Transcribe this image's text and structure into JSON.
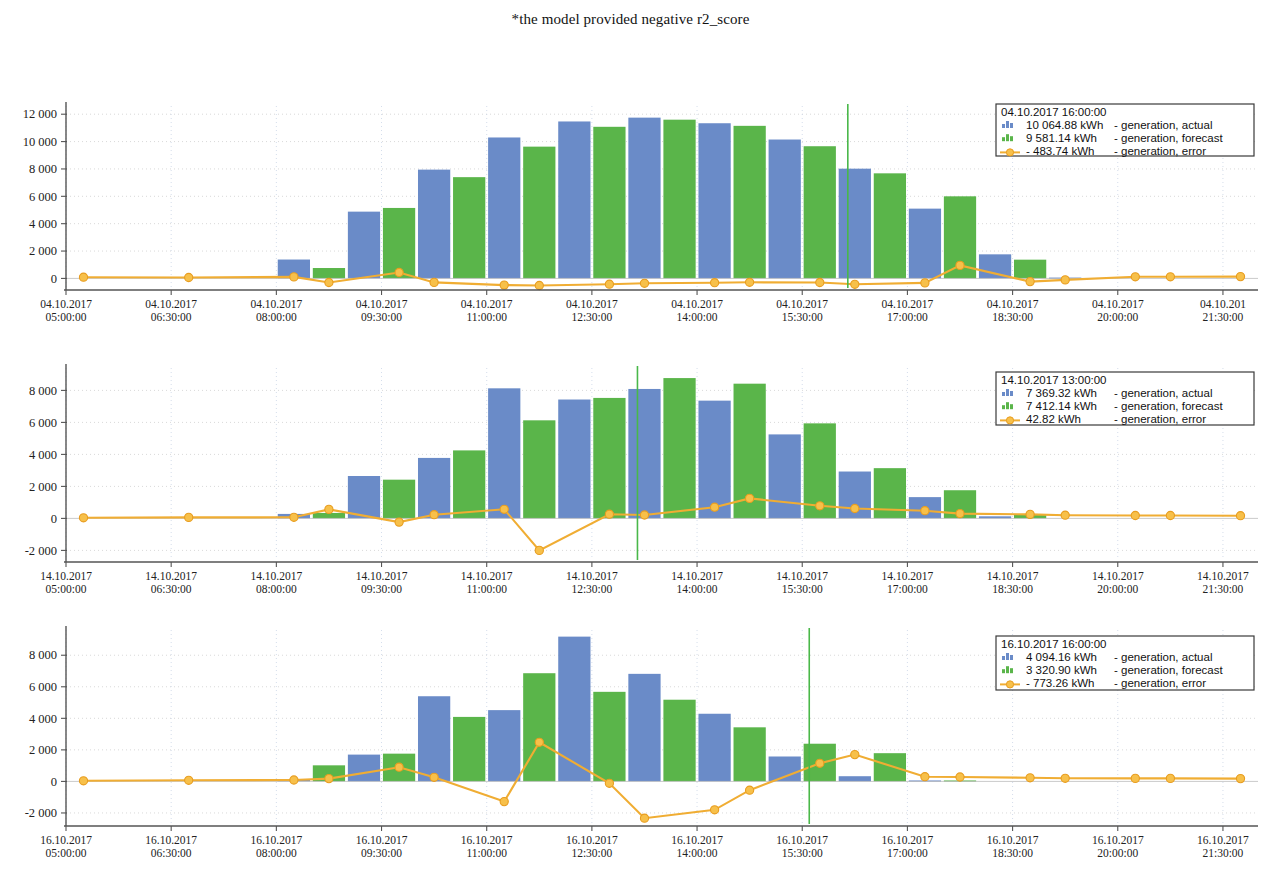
{
  "note": "*the model provided negative r2_score",
  "colors": {
    "actual": "#6a8bc8",
    "forecast": "#5ab54a",
    "error": "#f0ad33",
    "error_dot": "#f7c04a",
    "cursor": "#49b849",
    "axis": "#555555",
    "grid": "#cfcfcf"
  },
  "series_labels": {
    "actual": "- generation, actual",
    "forecast": "- generation, forecast",
    "error": "- generation, error",
    "unit": "kWh"
  },
  "chart_data": [
    {
      "type": "bar",
      "id": "chart-2017-10-04",
      "title": "",
      "xlabel": "",
      "ylabel": "",
      "ylim": [
        -700,
        12600
      ],
      "yticks": [
        0,
        2000,
        4000,
        6000,
        8000,
        10000,
        12000
      ],
      "ytick_labels": [
        "0",
        "2 000",
        "4 000",
        "6 000",
        "8 000",
        "10 000",
        "12 000"
      ],
      "grid": true,
      "date": "04.10.2017",
      "xtick_labels": [
        "04.10.2017\n05:00:00",
        "04.10.2017\n06:30:00",
        "04.10.2017\n08:00:00",
        "04.10.2017\n09:30:00",
        "04.10.2017\n11:00:00",
        "04.10.2017\n12:30:00",
        "04.10.2017\n14:00:00",
        "04.10.2017\n15:30:00",
        "04.10.2017\n17:00:00",
        "04.10.2017\n18:30:00",
        "04.10.2017\n20:00:00",
        "04.10.201\n21:30:00"
      ],
      "xtick_positions": [
        0,
        3,
        6,
        9,
        12,
        15,
        18,
        21,
        24,
        27,
        30,
        33
      ],
      "n_slots": 34,
      "categories": [
        "05:00",
        "05:30",
        "06:00",
        "06:30",
        "07:00",
        "07:30",
        "08:00",
        "08:30",
        "09:00",
        "09:30",
        "10:00",
        "10:30",
        "11:00",
        "11:30",
        "12:00",
        "12:30",
        "13:00",
        "13:30",
        "14:00",
        "14:30",
        "15:00",
        "15:30",
        "16:00",
        "16:30",
        "17:00",
        "17:30",
        "18:00",
        "18:30",
        "19:00",
        "19:30",
        "20:00",
        "20:30",
        "21:00",
        "21:30"
      ],
      "series": [
        {
          "name": "generation, actual",
          "values": [
            0,
            0,
            0,
            0,
            0,
            0,
            1380,
            0,
            4880,
            0,
            7950,
            0,
            10300,
            0,
            11470,
            0,
            11750,
            0,
            11340,
            0,
            10150,
            0,
            8020,
            0,
            5100,
            0,
            1760,
            0,
            60,
            0,
            0,
            0,
            0,
            0
          ]
        },
        {
          "name": "generation, forecast",
          "values": [
            0,
            0,
            0,
            0,
            0,
            0,
            0,
            760,
            0,
            5150,
            0,
            7400,
            0,
            9630,
            0,
            11080,
            0,
            11600,
            0,
            11150,
            0,
            9660,
            0,
            7680,
            0,
            6000,
            0,
            1370,
            0,
            0,
            0,
            0,
            0,
            0
          ]
        }
      ],
      "error_series": {
        "name": "generation, error",
        "x": [
          0,
          3,
          6,
          7,
          9,
          10,
          12,
          13,
          15,
          16,
          18,
          19,
          21,
          22,
          24,
          25,
          27,
          28,
          30,
          31,
          33
        ],
        "values": [
          90,
          70,
          110,
          -300,
          430,
          -290,
          -490,
          -520,
          -420,
          -360,
          -310,
          -280,
          -300,
          -430,
          -330,
          950,
          -230,
          -110,
          120,
          120,
          130
        ]
      },
      "cursor_x": 22.3,
      "legend": {
        "position": "top-right",
        "timestamp": "04.10.2017 16:00:00",
        "rows": [
          {
            "icon": "bar-blue-icon",
            "value": "10 064.88",
            "unit": "kWh",
            "label": "- generation, actual"
          },
          {
            "icon": "bar-green-icon",
            "value": "9 581.14",
            "unit": "kWh",
            "label": "- generation, forecast"
          },
          {
            "icon": "line-orange-icon",
            "value": "- 483.74",
            "unit": "kWh",
            "label": "- generation, error"
          }
        ]
      }
    },
    {
      "type": "bar",
      "id": "chart-2017-10-14",
      "title": "",
      "xlabel": "",
      "ylabel": "",
      "ylim": [
        -2600,
        9400
      ],
      "yticks": [
        -2000,
        0,
        2000,
        4000,
        6000,
        8000
      ],
      "ytick_labels": [
        "-2 000",
        "0",
        "2 000",
        "4 000",
        "6 000",
        "8 000"
      ],
      "grid": true,
      "date": "14.10.2017",
      "xtick_labels": [
        "14.10.2017\n05:00:00",
        "14.10.2017\n06:30:00",
        "14.10.2017\n08:00:00",
        "14.10.2017\n09:30:00",
        "14.10.2017\n11:00:00",
        "14.10.2017\n12:30:00",
        "14.10.2017\n14:00:00",
        "14.10.2017\n15:30:00",
        "14.10.2017\n17:00:00",
        "14.10.2017\n18:30:00",
        "14.10.2017\n20:00:00",
        "14.10.2017\n21:30:00"
      ],
      "xtick_positions": [
        0,
        3,
        6,
        9,
        12,
        15,
        18,
        21,
        24,
        27,
        30,
        33
      ],
      "n_slots": 34,
      "categories": [
        "05:00",
        "05:30",
        "06:00",
        "06:30",
        "07:00",
        "07:30",
        "08:00",
        "08:30",
        "09:00",
        "09:30",
        "10:00",
        "10:30",
        "11:00",
        "11:30",
        "12:00",
        "12:30",
        "13:00",
        "13:30",
        "14:00",
        "14:30",
        "15:00",
        "15:30",
        "16:00",
        "16:30",
        "17:00",
        "17:30",
        "18:00",
        "18:30",
        "19:00",
        "19:30",
        "20:00",
        "20:30",
        "21:00",
        "21:30"
      ],
      "series": [
        {
          "name": "generation, actual",
          "values": [
            0,
            0,
            0,
            0,
            0,
            0,
            280,
            0,
            2650,
            0,
            3780,
            0,
            8130,
            0,
            7430,
            0,
            8090,
            0,
            7360,
            0,
            5250,
            0,
            2930,
            0,
            1330,
            0,
            130,
            0,
            0,
            0,
            0,
            0,
            0,
            0
          ]
        },
        {
          "name": "generation, forecast",
          "values": [
            0,
            0,
            0,
            0,
            0,
            0,
            0,
            340,
            0,
            2420,
            0,
            4250,
            0,
            6130,
            0,
            7530,
            0,
            8770,
            0,
            8420,
            0,
            5940,
            0,
            3140,
            0,
            1760,
            0,
            230,
            0,
            0,
            0,
            0,
            0,
            0
          ]
        }
      ],
      "error_series": {
        "name": "generation, error",
        "x": [
          0,
          3,
          6,
          7,
          9,
          10,
          12,
          13,
          15,
          16,
          18,
          19,
          21,
          22,
          24,
          25,
          27,
          28,
          30,
          31,
          33
        ],
        "values": [
          40,
          60,
          70,
          560,
          -230,
          230,
          570,
          -2000,
          260,
          210,
          700,
          1250,
          790,
          620,
          480,
          300,
          250,
          200,
          180,
          180,
          170
        ]
      },
      "cursor_x": 16.3,
      "legend": {
        "position": "top-right",
        "timestamp": "14.10.2017 13:00:00",
        "rows": [
          {
            "icon": "bar-blue-icon",
            "value": "7 369.32",
            "unit": "kWh",
            "label": "- generation, actual"
          },
          {
            "icon": "bar-green-icon",
            "value": "7 412.14",
            "unit": "kWh",
            "label": "- generation, forecast"
          },
          {
            "icon": "line-orange-icon",
            "value": "42.82",
            "unit": "kWh",
            "label": "- generation, error"
          }
        ]
      }
    },
    {
      "type": "bar",
      "id": "chart-2017-10-16",
      "title": "",
      "xlabel": "",
      "ylabel": "",
      "ylim": [
        -2700,
        9600
      ],
      "yticks": [
        -2000,
        0,
        2000,
        4000,
        6000,
        8000
      ],
      "ytick_labels": [
        "-2 000",
        "0",
        "2 000",
        "4 000",
        "6 000",
        "8 000"
      ],
      "grid": true,
      "date": "16.10.2017",
      "xtick_labels": [
        "16.10.2017\n05:00:00",
        "16.10.2017\n06:30:00",
        "16.10.2017\n08:00:00",
        "16.10.2017\n09:30:00",
        "16.10.2017\n11:00:00",
        "16.10.2017\n12:30:00",
        "16.10.2017\n14:00:00",
        "16.10.2017\n15:30:00",
        "16.10.2017\n17:00:00",
        "16.10.2017\n18:30:00",
        "16.10.2017\n20:00:00",
        "16.10.2017\n21:30:00"
      ],
      "xtick_positions": [
        0,
        3,
        6,
        9,
        12,
        15,
        18,
        21,
        24,
        27,
        30,
        33
      ],
      "n_slots": 34,
      "categories": [
        "05:00",
        "05:30",
        "06:00",
        "06:30",
        "07:00",
        "07:30",
        "08:00",
        "08:30",
        "09:00",
        "09:30",
        "10:00",
        "10:30",
        "11:00",
        "11:30",
        "12:00",
        "12:30",
        "13:00",
        "13:30",
        "14:00",
        "14:30",
        "15:00",
        "15:30",
        "16:00",
        "16:30",
        "17:00",
        "17:30",
        "18:00",
        "18:30",
        "19:00",
        "19:30",
        "20:00",
        "20:30",
        "21:00",
        "21:30"
      ],
      "series": [
        {
          "name": "generation, actual",
          "values": [
            0,
            0,
            0,
            0,
            0,
            0,
            130,
            0,
            1700,
            0,
            5400,
            0,
            4520,
            0,
            9180,
            0,
            6820,
            0,
            4290,
            0,
            1580,
            0,
            330,
            0,
            60,
            0,
            0,
            0,
            0,
            0,
            0,
            0,
            0,
            0
          ]
        },
        {
          "name": "generation, forecast",
          "values": [
            0,
            0,
            0,
            0,
            0,
            0,
            0,
            1020,
            0,
            1760,
            0,
            4090,
            0,
            6860,
            0,
            5680,
            0,
            5180,
            0,
            3430,
            0,
            2390,
            0,
            1790,
            0,
            60,
            0,
            0,
            0,
            0,
            0,
            0,
            0,
            0
          ]
        }
      ],
      "error_series": {
        "name": "generation, error",
        "x": [
          0,
          3,
          6,
          7,
          9,
          10,
          12,
          13,
          15,
          16,
          18,
          19,
          21,
          22,
          24,
          25,
          27,
          28,
          30,
          31,
          33
        ],
        "values": [
          40,
          70,
          90,
          180,
          900,
          260,
          -1280,
          2480,
          -120,
          -2330,
          -1800,
          -560,
          1150,
          1700,
          300,
          280,
          230,
          200,
          190,
          190,
          180
        ]
      },
      "cursor_x": 21.2,
      "legend": {
        "position": "top-right",
        "timestamp": "16.10.2017 16:00:00",
        "rows": [
          {
            "icon": "bar-blue-icon",
            "value": "4 094.16",
            "unit": "kWh",
            "label": "- generation, actual"
          },
          {
            "icon": "bar-green-icon",
            "value": "3 320.90",
            "unit": "kWh",
            "label": "- generation, forecast"
          },
          {
            "icon": "line-orange-icon",
            "value": "- 773.26",
            "unit": "kWh",
            "label": "- generation, error"
          }
        ]
      }
    }
  ]
}
